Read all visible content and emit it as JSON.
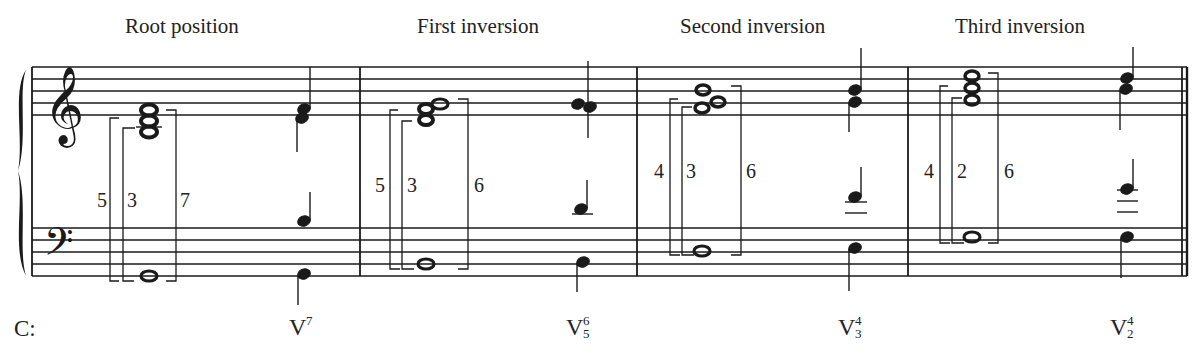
{
  "key_label": "C:",
  "sections": [
    {
      "heading": "Root position",
      "intervals": [
        "5",
        "3",
        "7"
      ],
      "roman": "V",
      "figure_top": "7",
      "figure_bottom": ""
    },
    {
      "heading": "First inversion",
      "intervals": [
        "5",
        "3",
        "6"
      ],
      "roman": "V",
      "figure_top": "6",
      "figure_bottom": "5"
    },
    {
      "heading": "Second inversion",
      "intervals": [
        "4",
        "3",
        "6"
      ],
      "roman": "V",
      "figure_top": "4",
      "figure_bottom": "3"
    },
    {
      "heading": "Third inversion",
      "intervals": [
        "4",
        "2",
        "6"
      ],
      "roman": "V",
      "figure_top": "4",
      "figure_bottom": "2"
    }
  ],
  "colors": {
    "ink": "#1a1a1a",
    "background": "#ffffff"
  }
}
